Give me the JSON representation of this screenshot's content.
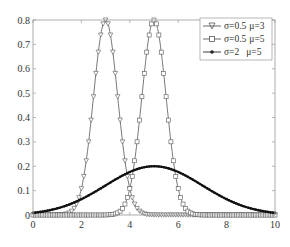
{
  "chart_data": {
    "type": "line",
    "title": "",
    "xlabel": "",
    "ylabel": "",
    "xlim": [
      0,
      10
    ],
    "ylim": [
      0,
      0.8
    ],
    "xticks": [
      "0",
      "2",
      "4",
      "6",
      "8",
      "10"
    ],
    "yticks": [
      "0",
      "0.1",
      "0.2",
      "0.3",
      "0.4",
      "0.5",
      "0.6",
      "0.7",
      "0.8"
    ],
    "grid": false,
    "legend_position": "upper right",
    "series": [
      {
        "name": "σ=0.5 μ=3",
        "sigma": 0.5,
        "mu": 3,
        "marker": "triangle-down",
        "peak": 0.8
      },
      {
        "name": "σ=0.5 μ=5",
        "sigma": 0.5,
        "mu": 5,
        "marker": "square",
        "peak": 0.8
      },
      {
        "name": "σ=2 μ=5",
        "sigma": 2,
        "mu": 5,
        "marker": "dot",
        "peak": 0.2
      }
    ]
  },
  "legend": {
    "items": [
      {
        "sigma_label": "σ=0.5",
        "mu_label": "μ=3"
      },
      {
        "sigma_label": "σ=0.5",
        "mu_label": "μ=5"
      },
      {
        "sigma_label": "σ=2",
        "mu_label": "μ=5"
      }
    ]
  }
}
